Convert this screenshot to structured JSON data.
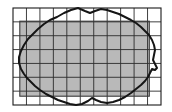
{
  "figure": {
    "type": "geometric-diagram",
    "title": "Irregular region overlaid on a rectangular grid",
    "background_color": "#ffffff",
    "canvas": {
      "width": 172,
      "height": 112
    }
  },
  "grid": {
    "name": "coordinate-grid",
    "origin_x": 13,
    "origin_y": 8,
    "width": 148,
    "height": 97,
    "columns": 11,
    "rows": 7,
    "cell_width": 13.45,
    "cell_height": 13.86,
    "line_color": "#2b2b2b",
    "line_width": 0.9,
    "border_color": "#1a1a1a",
    "border_width": 1.1,
    "show_grid": true
  },
  "shaded_rectangle": {
    "name": "inner-approximating-rectangle",
    "x": 19.8,
    "y": 21.2,
    "width": 129.5,
    "height": 75.0,
    "fill_color": "#b9b9b9",
    "stroke_color": "#3a3a3a",
    "stroke_width": 1.1,
    "columns_spanned": 9,
    "rows_spanned": 5
  },
  "region_curve": {
    "name": "irregular-closed-region",
    "stroke_color": "#151515",
    "stroke_width": 2.0,
    "fill": "none",
    "closed": true,
    "path": "M 78 8 L 71 10 L 64 13 L 57 17 L 50 20 L 44 24 L 38 29 L 33 34 L 28 39 L 24 45 L 21 51 L 19 57 L 19 63 L 21 69 L 24 74 L 27 78 L 31 82 L 35 86 L 40 90 L 46 94 L 52 97 L 58 100 L 64 102 L 70 104 L 76 105 L 82 104 L 88 101 L 92 98 L 96 100 L 101 102 L 107 103 L 113 102 L 119 100 L 125 97 L 131 93 L 136 89 L 141 85 L 145 81 L 148 77 L 150 73 L 152 69 L 155 70 L 157 68 L 155 64 L 153 60 L 154 55 L 155 50 L 154 45 L 152 40 L 149 35 L 145 31 L 141 27 L 136 23 L 131 20 L 125 17 L 119 14 L 113 12 L 107 10 L 101 9 L 95 11 L 90 13 L 85 11 L 78 8 Z"
  },
  "legend": {
    "shown": false,
    "items": []
  },
  "labels": {
    "shown": false,
    "items": []
  },
  "colors": {
    "shade_gray": "#b9b9b9",
    "grid_line": "#2b2b2b",
    "curve_black": "#151515",
    "background_white": "#ffffff"
  }
}
